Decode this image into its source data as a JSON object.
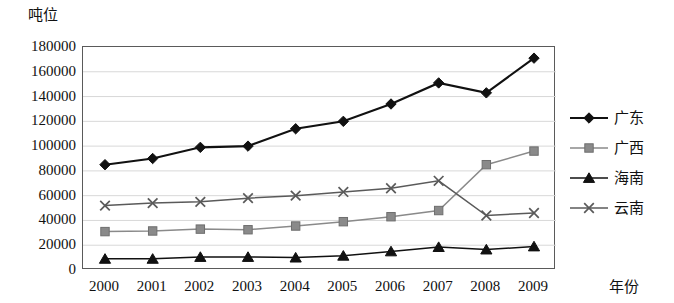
{
  "chart_data": {
    "type": "line",
    "title": "",
    "xlabel": "年份",
    "ylabel": "吨位",
    "x": [
      2000,
      2001,
      2002,
      2003,
      2004,
      2005,
      2006,
      2007,
      2008,
      2009
    ],
    "categories": [
      "2000",
      "2001",
      "2002",
      "2003",
      "2004",
      "2005",
      "2006",
      "2007",
      "2008",
      "2009"
    ],
    "series": [
      {
        "name": "广东",
        "marker": "diamond",
        "color": "#111111",
        "values": [
          85000,
          90000,
          99000,
          100000,
          114000,
          120000,
          134000,
          151000,
          143000,
          171000
        ]
      },
      {
        "name": "广西",
        "marker": "square",
        "color": "#8a8a8a",
        "values": [
          31000,
          31500,
          33000,
          32500,
          35500,
          39000,
          43000,
          48000,
          85000,
          96000
        ]
      },
      {
        "name": "海南",
        "marker": "triangle",
        "color": "#111111",
        "values": [
          9000,
          9000,
          10500,
          10500,
          10000,
          11500,
          15000,
          18500,
          16500,
          19000
        ]
      },
      {
        "name": "云南",
        "marker": "x",
        "color": "#5a5a5a",
        "values": [
          52000,
          54000,
          55000,
          58000,
          60000,
          63000,
          66000,
          72000,
          44000,
          46000
        ]
      }
    ],
    "ylim": [
      0,
      180000
    ],
    "yticks": [
      0,
      20000,
      40000,
      60000,
      80000,
      100000,
      120000,
      140000,
      160000,
      180000
    ],
    "ytick_labels": [
      "0",
      "20000",
      "40000",
      "60000",
      "80000",
      "100000",
      "120000",
      "140000",
      "160000",
      "180000"
    ],
    "grid": true,
    "grid_axis": "y",
    "legend_position": "right",
    "legend_entries": [
      "广东",
      "广西",
      "海南",
      "云南"
    ]
  }
}
